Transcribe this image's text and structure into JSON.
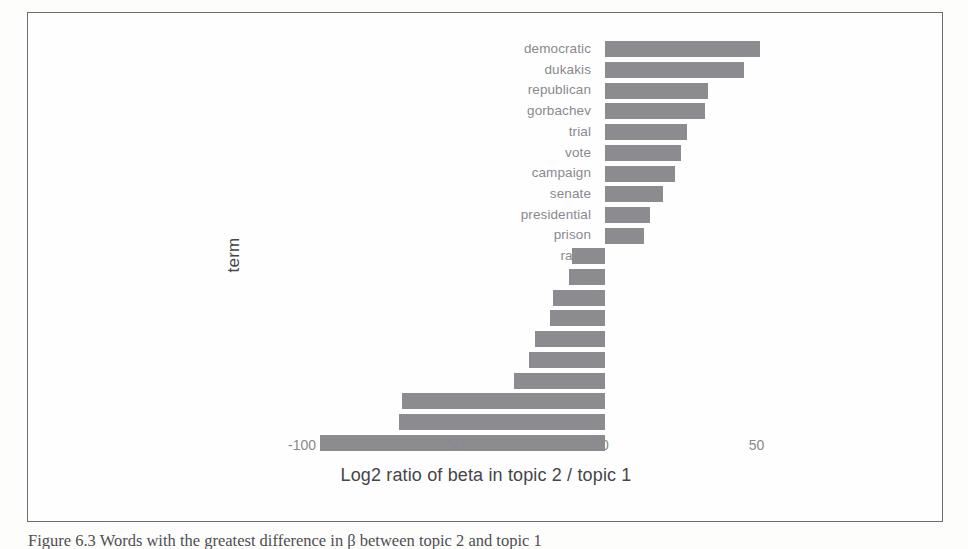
{
  "figure": {
    "caption": "Figure 6.3 Words with the greatest difference in β between topic 2 and topic 1"
  },
  "chart_data": {
    "type": "bar",
    "orientation": "horizontal",
    "title": "",
    "xlabel": "Log2 ratio of beta in topic 2 / topic 1",
    "ylabel": "term",
    "xlim": [
      -100,
      55
    ],
    "xticks": [
      -100,
      -50,
      0,
      50
    ],
    "xticklabels": [
      "-100",
      "-50",
      "0",
      "50"
    ],
    "grid": false,
    "legend": null,
    "bar_color": "#8c8b90",
    "categories": [
      "democratic",
      "dukakis",
      "republican",
      "gorbachev",
      "trial",
      "vote",
      "campaign",
      "senate",
      "presidential",
      "prison",
      "rates",
      "fell",
      "rate",
      "prices",
      "dollar",
      "stock",
      "average",
      "cents",
      "index",
      "yen"
    ],
    "values": [
      51,
      46,
      34,
      33,
      27,
      25,
      23,
      19,
      15,
      13,
      -11,
      -12,
      -17,
      -18,
      -23,
      -25,
      -30,
      -67,
      -68,
      -94
    ]
  }
}
